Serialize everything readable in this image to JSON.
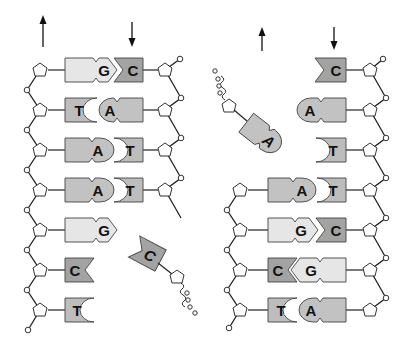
{
  "diagram": {
    "colors": {
      "A": "#c2c2c2",
      "T": "#bdbdbd",
      "G": "#e6e6e6",
      "C": "#a3a3a3",
      "background": "#ffffff",
      "line": "#222222"
    },
    "arrows": [
      {
        "id": "left-strand-1",
        "direction": "up"
      },
      {
        "id": "left-strand-2",
        "direction": "down"
      },
      {
        "id": "right-strand-1",
        "direction": "up"
      },
      {
        "id": "right-strand-2",
        "direction": "down"
      }
    ],
    "left_molecule": {
      "pairs": [
        {
          "left": "G",
          "right": "C"
        },
        {
          "left": "T",
          "right": "A"
        },
        {
          "left": "A",
          "right": "T"
        },
        {
          "left": "A",
          "right": "T"
        },
        {
          "left": "G",
          "right": null
        },
        {
          "left": "C",
          "right": null
        },
        {
          "left": "T",
          "right": null
        }
      ],
      "free_nucleotide": {
        "base": "C"
      }
    },
    "right_molecule": {
      "pairs": [
        {
          "left": null,
          "right": "C"
        },
        {
          "left": null,
          "right": "A"
        },
        {
          "left": null,
          "right": "T"
        },
        {
          "left": "A",
          "right": "T"
        },
        {
          "left": "G",
          "right": "C"
        },
        {
          "left": "C",
          "right": "G"
        },
        {
          "left": "T",
          "right": "A"
        }
      ],
      "free_nucleotide": {
        "base": "A"
      }
    }
  }
}
